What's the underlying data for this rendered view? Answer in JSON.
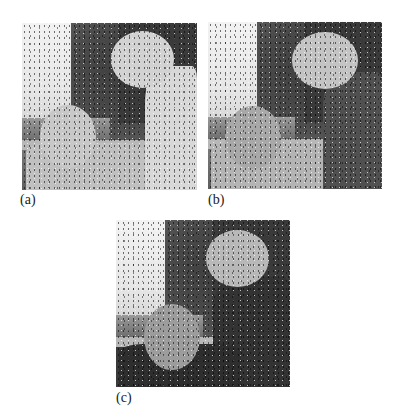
{
  "figure": {
    "panels": [
      {
        "id": "a",
        "label": "(a)",
        "description": "noisy grayscale photo of two children, bright clothing",
        "tones": {
          "child_right_body": "#d8d8d8",
          "child_right_head": "#d2d2d2",
          "child_left_head": "#c8c8c8",
          "child_left_body": "#c0c0c0"
        }
      },
      {
        "id": "b",
        "label": "(b)",
        "description": "noisy grayscale photo of two children, right child in dark clothing",
        "tones": {
          "child_right_body": "#505050",
          "child_right_head": "#c4c4c4",
          "child_left_head": "#a8a8a8",
          "child_left_body": "#b4b4b4"
        }
      },
      {
        "id": "c",
        "label": "(c)",
        "description": "noisy grayscale photo of two children, both in dark clothing",
        "tones": {
          "child_right_body": "#333333",
          "child_right_head": "#b8b8b8",
          "child_left_head": "#9c9c9c",
          "child_left_body": "#2e2e2e"
        }
      }
    ]
  }
}
